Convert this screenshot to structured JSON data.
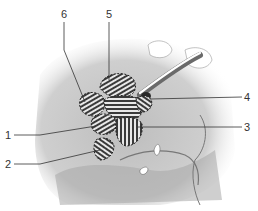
{
  "figure": {
    "type": "anatomical-illustration",
    "style": "grayscale pencil drawing with hatched regions outlined by dashed borders",
    "colors": {
      "background": "#ffffff",
      "tissue_light": "#d9d9d9",
      "tissue_mid": "#a8a8a8",
      "tissue_dark": "#555555",
      "leader_line": "#333333",
      "hatch": "#3a3a3a"
    },
    "callouts": [
      {
        "id": "1",
        "label": "1",
        "side": "left"
      },
      {
        "id": "2",
        "label": "2",
        "side": "left"
      },
      {
        "id": "3",
        "label": "3",
        "side": "right"
      },
      {
        "id": "4",
        "label": "4",
        "side": "right"
      },
      {
        "id": "5",
        "label": "5",
        "side": "top"
      },
      {
        "id": "6",
        "label": "6",
        "side": "top"
      }
    ]
  }
}
